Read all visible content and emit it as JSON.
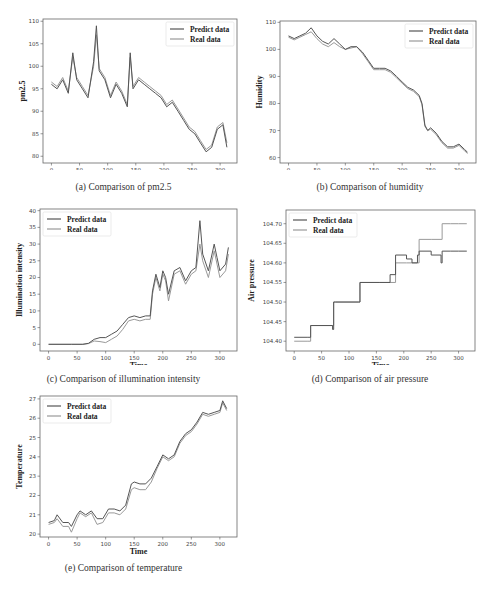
{
  "figure": {
    "captions": {
      "a": "(a) Comparison of pm2.5",
      "b": "(b) Comparison of humidity",
      "c": "(c) Comparison of illumination intensity",
      "d": "(d) Comparison of air pressure",
      "e": "(e) Comparison of temperature"
    },
    "legend": {
      "predict": "Predict data",
      "real": "Real data"
    },
    "colors": {
      "predict": "#555555",
      "real": "#999999",
      "frame": "#666666"
    }
  },
  "chart_data": [
    {
      "id": "a",
      "type": "line",
      "title": "(a) Comparison of pm2.5",
      "xlabel": "Time",
      "ylabel": "pm2.5",
      "xlim": [
        -15,
        330
      ],
      "ylim": [
        78.5,
        110.5
      ],
      "xticks": [
        0,
        50,
        100,
        150,
        200,
        250,
        300
      ],
      "yticks": [
        80,
        85,
        90,
        95,
        100,
        105,
        110
      ],
      "legend_position": "upper right",
      "grid": false,
      "x": [
        0,
        10,
        20,
        30,
        38,
        45,
        55,
        65,
        75,
        80,
        85,
        95,
        105,
        115,
        125,
        135,
        140,
        145,
        155,
        165,
        175,
        185,
        195,
        205,
        215,
        225,
        235,
        245,
        255,
        265,
        275,
        285,
        295,
        305,
        312
      ],
      "series": [
        {
          "name": "Predict data",
          "values": [
            96,
            95,
            97,
            94,
            103,
            97,
            95,
            93,
            101,
            109,
            99,
            97,
            93,
            96,
            94,
            91,
            103,
            95,
            97,
            96,
            95,
            94,
            93,
            91,
            92,
            90,
            88,
            86,
            85,
            83,
            81,
            82,
            86,
            87,
            82
          ]
        },
        {
          "name": "Real data",
          "values": [
            96.5,
            95.5,
            97.5,
            94.5,
            102,
            97.5,
            95.5,
            93.5,
            100,
            107,
            99.5,
            97.5,
            93.5,
            96.5,
            94.5,
            91.5,
            102,
            95.5,
            97.5,
            96.5,
            95.5,
            94.5,
            93.5,
            91.5,
            92.5,
            90.5,
            88.5,
            86.5,
            85.5,
            83.5,
            81.5,
            82.5,
            86.5,
            87.5,
            83
          ]
        }
      ]
    },
    {
      "id": "b",
      "type": "line",
      "title": "(b) Comparison of humidity",
      "xlabel": "Time",
      "ylabel": "Humidity",
      "xlim": [
        -15,
        330
      ],
      "ylim": [
        58,
        110.5
      ],
      "xticks": [
        0,
        50,
        100,
        150,
        200,
        250,
        300
      ],
      "yticks": [
        60,
        70,
        80,
        90,
        100,
        110
      ],
      "legend_position": "upper right",
      "grid": false,
      "x": [
        0,
        10,
        20,
        30,
        40,
        50,
        60,
        70,
        80,
        90,
        100,
        110,
        120,
        130,
        140,
        150,
        160,
        170,
        180,
        190,
        200,
        210,
        220,
        230,
        235,
        240,
        245,
        250,
        260,
        270,
        280,
        290,
        300,
        310,
        315
      ],
      "series": [
        {
          "name": "Predict data",
          "values": [
            105,
            104,
            105,
            106,
            108,
            105,
            103,
            102,
            104,
            102,
            100,
            101,
            101,
            99,
            96,
            93,
            93,
            93,
            92,
            90,
            88,
            86,
            85,
            83,
            80,
            72,
            70,
            71,
            69,
            66,
            64,
            64,
            65,
            63,
            62
          ]
        },
        {
          "name": "Real data",
          "values": [
            104.5,
            103.5,
            104.5,
            105.5,
            106.5,
            104,
            102,
            101,
            102.5,
            101,
            100,
            100.5,
            101,
            98.5,
            95.5,
            92.5,
            92.5,
            92.5,
            91.5,
            89.5,
            87.5,
            85.5,
            84.5,
            82.5,
            79.5,
            71.5,
            70,
            70.5,
            68.5,
            65.5,
            63.5,
            63.5,
            64.5,
            62.5,
            61.5
          ]
        }
      ]
    },
    {
      "id": "c",
      "type": "line",
      "title": "(c) Comparison of illumination intensity",
      "xlabel": "Time",
      "ylabel": "Illumination intensity",
      "xlim": [
        -15,
        330
      ],
      "ylim": [
        -2,
        40.5
      ],
      "xticks": [
        0,
        50,
        100,
        150,
        200,
        250,
        300
      ],
      "yticks": [
        0,
        5,
        10,
        15,
        20,
        25,
        30,
        35,
        40
      ],
      "legend_position": "upper left",
      "grid": false,
      "x": [
        0,
        20,
        40,
        60,
        70,
        80,
        90,
        100,
        110,
        120,
        130,
        140,
        150,
        160,
        170,
        178,
        182,
        188,
        195,
        200,
        205,
        210,
        220,
        230,
        240,
        250,
        258,
        265,
        270,
        280,
        290,
        295,
        300,
        310,
        315
      ],
      "series": [
        {
          "name": "Predict data",
          "values": [
            0,
            0,
            0,
            0,
            0.3,
            1.5,
            2,
            2,
            3,
            4,
            6,
            8,
            8.5,
            8,
            8.5,
            8.5,
            16,
            21,
            17,
            22,
            20,
            15,
            22,
            23,
            19,
            22,
            23,
            37,
            27,
            22,
            30,
            26,
            22,
            24,
            29
          ]
        },
        {
          "name": "Real data",
          "values": [
            0,
            0,
            0,
            0,
            0.2,
            1,
            0.8,
            0.5,
            1.5,
            2.5,
            4.5,
            7,
            7.5,
            7,
            7.5,
            7.5,
            15,
            20,
            16,
            21,
            19,
            13,
            21,
            22,
            18,
            21,
            22,
            30,
            25,
            20,
            28,
            24,
            20,
            22,
            27
          ]
        }
      ]
    },
    {
      "id": "d",
      "type": "line",
      "title": "(d) Comparison of air pressure",
      "xlabel": "Time",
      "ylabel": "Air pressure",
      "xlim": [
        -15,
        330
      ],
      "ylim": [
        104.375,
        104.735
      ],
      "xticks": [
        0,
        50,
        100,
        150,
        200,
        250,
        300
      ],
      "yticks": [
        104.4,
        104.45,
        104.5,
        104.55,
        104.6,
        104.65,
        104.7
      ],
      "ytick_labels": [
        "104.40",
        "104.45",
        "104.50",
        "104.55",
        "104.60",
        "104.65",
        "104.70"
      ],
      "legend_position": "upper left",
      "grid": false,
      "x": [
        0,
        25,
        30,
        70,
        72,
        75,
        118,
        120,
        155,
        175,
        185,
        205,
        215,
        225,
        228,
        250,
        268,
        270,
        285,
        300,
        315
      ],
      "series": [
        {
          "name": "Predict data",
          "values": [
            104.41,
            104.41,
            104.44,
            104.43,
            104.5,
            104.5,
            104.5,
            104.55,
            104.55,
            104.57,
            104.62,
            104.61,
            104.6,
            104.62,
            104.63,
            104.62,
            104.6,
            104.63,
            104.63,
            104.63,
            104.63
          ]
        },
        {
          "name": "Real data",
          "values": [
            104.4,
            104.4,
            104.44,
            104.44,
            104.5,
            104.5,
            104.5,
            104.55,
            104.55,
            104.55,
            104.6,
            104.6,
            104.6,
            104.6,
            104.66,
            104.66,
            104.66,
            104.7,
            104.7,
            104.7,
            104.7
          ]
        }
      ]
    },
    {
      "id": "e",
      "type": "line",
      "title": "(e) Comparison of temperature",
      "xlabel": "Time",
      "ylabel": "Temperature",
      "xlim": [
        -15,
        330
      ],
      "ylim": [
        19.85,
        27.15
      ],
      "xticks": [
        0,
        50,
        100,
        150,
        200,
        250,
        300
      ],
      "yticks": [
        20,
        21,
        22,
        23,
        24,
        25,
        26,
        27
      ],
      "legend_position": "upper left",
      "grid": false,
      "x": [
        0,
        10,
        15,
        25,
        35,
        40,
        50,
        55,
        65,
        75,
        85,
        95,
        105,
        115,
        125,
        135,
        145,
        150,
        160,
        170,
        180,
        190,
        200,
        210,
        220,
        230,
        240,
        250,
        260,
        270,
        280,
        290,
        300,
        305,
        312
      ],
      "series": [
        {
          "name": "Predict data",
          "values": [
            20.6,
            20.7,
            21,
            20.6,
            20.6,
            20.4,
            21,
            21.2,
            21,
            21.2,
            20.8,
            20.8,
            21.3,
            21.3,
            21.2,
            21.5,
            22.6,
            22.7,
            22.6,
            22.6,
            22.9,
            23.5,
            24.1,
            23.9,
            24.1,
            24.8,
            25.2,
            25.4,
            25.8,
            26.3,
            26.2,
            26.3,
            26.4,
            26.9,
            26.5
          ]
        },
        {
          "name": "Real data",
          "values": [
            20.5,
            20.6,
            20.8,
            20.4,
            20.4,
            20.1,
            20.8,
            21.1,
            20.9,
            21.1,
            20.5,
            20.6,
            21.1,
            21.1,
            21,
            21.3,
            22.3,
            22.4,
            22.3,
            22.3,
            22.7,
            23.4,
            24,
            23.8,
            24,
            24.7,
            25.1,
            25.3,
            25.7,
            26.2,
            26.1,
            26.2,
            26.3,
            26.8,
            26.4
          ]
        }
      ]
    }
  ]
}
